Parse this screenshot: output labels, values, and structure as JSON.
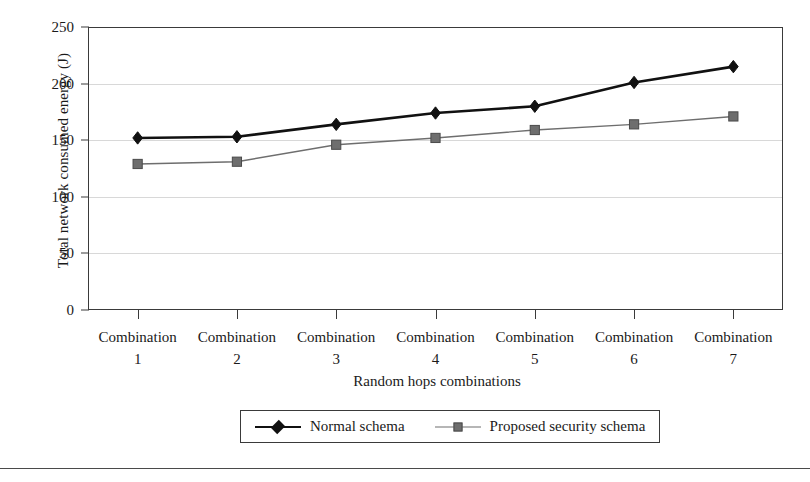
{
  "chart_data": {
    "type": "line",
    "title": "",
    "xlabel": "Random hops combinations",
    "ylabel": "Total network consumed energy (J)",
    "categories": [
      "Combination 1",
      "Combination 2",
      "Combination 3",
      "Combination 4",
      "Combination 5",
      "Combination 6",
      "Combination 7"
    ],
    "category_words": [
      "Combination",
      "Combination",
      "Combination",
      "Combination",
      "Combination",
      "Combination",
      "Combination"
    ],
    "category_numbers": [
      "1",
      "2",
      "3",
      "4",
      "5",
      "6",
      "7"
    ],
    "series": [
      {
        "name": "Normal schema",
        "values": [
          152,
          153,
          164,
          174,
          180,
          201,
          215
        ],
        "color": "#111111",
        "marker": "diamond",
        "line_width": 2.6
      },
      {
        "name": "Proposed security schema",
        "values": [
          129,
          131,
          146,
          152,
          159,
          164,
          171
        ],
        "color": "#6e6e6e",
        "marker": "square",
        "line_width": 1.4
      }
    ],
    "ylim": [
      0,
      250
    ],
    "yticks": [
      0,
      50,
      100,
      150,
      200,
      250
    ],
    "ytick_labels": [
      "0",
      "50",
      "100",
      "150",
      "200",
      "250"
    ],
    "grid": true,
    "grid_color": "#d8d8d8",
    "legend_position": "bottom-center",
    "axis_color": "#3a3a3a"
  }
}
